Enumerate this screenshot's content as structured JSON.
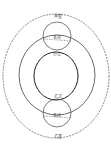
{
  "diagram": {
    "labels": {
      "top_outer": "甲星",
      "top_center": "本点",
      "top_inner": "小卫",
      "bottom_inner": "乙卫",
      "bottom_center": "本点",
      "bottom_outer": "乙星"
    }
  }
}
